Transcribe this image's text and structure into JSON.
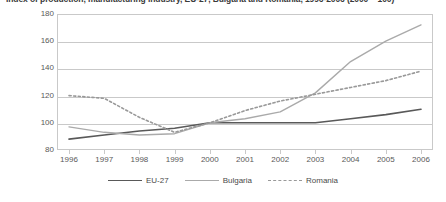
{
  "chart_data": {
    "type": "line",
    "title": "Index of production, manufacturing industry, EU-27, Bulgaria and Romania, 1996-2006 (2000 = 100)",
    "xlabel": "",
    "ylabel": "",
    "x": [
      1996,
      1997,
      1998,
      1999,
      2000,
      2001,
      2002,
      2003,
      2004,
      2005,
      2006
    ],
    "categories": [
      "1996",
      "1997",
      "1998",
      "1999",
      "2000",
      "2001",
      "2002",
      "2003",
      "2004",
      "2005",
      "2006"
    ],
    "ylim": [
      80,
      180
    ],
    "yticks": [
      80,
      100,
      120,
      140,
      160,
      180
    ],
    "ytick_labels": [
      "80",
      "100",
      "120",
      "140",
      "160",
      "180"
    ],
    "grid": "horizontal",
    "legend_position": "bottom",
    "series": [
      {
        "name": "EU-27",
        "style": "solid",
        "color": "#595959",
        "width": 1.6,
        "values": [
          88,
          91,
          94,
          96,
          100,
          100,
          100,
          100,
          103,
          106,
          110
        ]
      },
      {
        "name": "Bulgaria",
        "style": "solid",
        "color": "#aaaaaa",
        "width": 1.4,
        "values": [
          97,
          93,
          91,
          92,
          100,
          103,
          108,
          122,
          145,
          160,
          172
        ]
      },
      {
        "name": "Romania",
        "style": "dotted",
        "color": "#999999",
        "width": 1.6,
        "values": [
          120,
          118,
          104,
          93,
          100,
          109,
          116,
          121,
          126,
          131,
          138
        ]
      }
    ]
  },
  "legend": {
    "items": [
      {
        "label": "EU-27"
      },
      {
        "label": "Bulgaria"
      },
      {
        "label": "Romania"
      }
    ]
  },
  "colors": {
    "eu27": "#595959",
    "bulgaria": "#aaaaaa",
    "romania": "#999999",
    "grid": "#c9c9c9",
    "text": "#4a4a4a",
    "background": "#ffffff"
  }
}
